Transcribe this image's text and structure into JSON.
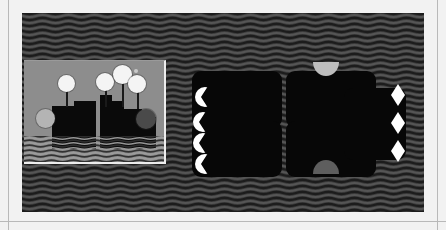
{
  "canvas": {
    "width": 446,
    "height": 230,
    "page_background": "#ffffff",
    "frame_color": "#b9b9b9"
  },
  "backdrop": {
    "name": "wavy-texture-backdrop",
    "base_color": "#3a3a3a",
    "wave_color": "#1c1c1c",
    "highlight_color": "#555555",
    "x": 22,
    "y": 13,
    "width": 402,
    "height": 199,
    "pattern": "horizontal-wavy-lines"
  },
  "inset_panel": {
    "name": "inset-panel",
    "background": "#8d8d8d",
    "border_color": "#ededed",
    "x": 24,
    "y": 60,
    "width": 140,
    "height": 101,
    "blocks": [
      {
        "name": "skyline-block-1",
        "x": 28,
        "y": 58,
        "w": 22,
        "h": 30,
        "color": "#0a0a0a"
      },
      {
        "name": "skyline-block-2",
        "x": 28,
        "y": 45,
        "w": 44,
        "h": 43,
        "color": "#0a0a0a"
      },
      {
        "name": "skyline-block-3",
        "x": 50,
        "y": 40,
        "w": 22,
        "h": 48,
        "color": "#0a0a0a"
      },
      {
        "name": "skyline-block-4",
        "x": 76,
        "y": 40,
        "w": 24,
        "h": 48,
        "color": "#0a0a0a"
      },
      {
        "name": "skyline-block-5",
        "x": 76,
        "y": 34,
        "w": 12,
        "h": 54,
        "color": "#0a0a0a"
      },
      {
        "name": "skyline-block-6",
        "x": 100,
        "y": 48,
        "w": 18,
        "h": 40,
        "color": "#0a0a0a"
      },
      {
        "name": "skyline-block-7",
        "x": 100,
        "y": 56,
        "w": 32,
        "h": 32,
        "color": "#0a0a0a"
      }
    ],
    "stems": [
      {
        "name": "stem-left",
        "x": 42,
        "y": 22,
        "h": 24
      },
      {
        "name": "stem-center",
        "x": 81,
        "y": 20,
        "h": 26
      },
      {
        "name": "stem-top",
        "x": 98,
        "y": 12,
        "h": 34
      },
      {
        "name": "stem-right",
        "x": 113,
        "y": 22,
        "h": 26
      }
    ],
    "circles": [
      {
        "name": "white-circle-left",
        "x": 34,
        "y": 14,
        "d": 17,
        "color": "#f4f4f4",
        "tone": ""
      },
      {
        "name": "white-circle-center",
        "x": 72,
        "y": 12,
        "d": 18,
        "color": "#f4f4f4",
        "tone": ""
      },
      {
        "name": "white-circle-top",
        "x": 89,
        "y": 4,
        "d": 19,
        "color": "#f4f4f4",
        "tone": ""
      },
      {
        "name": "white-circle-right",
        "x": 104,
        "y": 14,
        "d": 18,
        "color": "#f4f4f4",
        "tone": ""
      },
      {
        "name": "gray-circle",
        "x": 12,
        "y": 48,
        "d": 19,
        "color": "#b4b4b4",
        "tone": "gray"
      },
      {
        "name": "dark-circle",
        "x": 112,
        "y": 48,
        "d": 20,
        "color": "#4a4a4a",
        "tone": "dark"
      },
      {
        "name": "tiny-dot",
        "x": 110,
        "y": 8,
        "d": 4,
        "color": "#c9c9c9",
        "tone": "tiny"
      }
    ]
  },
  "cards": [
    {
      "name": "card-top-left",
      "x": 192,
      "y": 71,
      "w": 90,
      "h": 57,
      "color": "#070707"
    },
    {
      "name": "card-top-right",
      "x": 286,
      "y": 71,
      "w": 90,
      "h": 57,
      "color": "#070707"
    },
    {
      "name": "card-bottom-left",
      "x": 192,
      "y": 121,
      "w": 90,
      "h": 56,
      "color": "#070707"
    },
    {
      "name": "card-bottom-right",
      "x": 286,
      "y": 121,
      "w": 90,
      "h": 56,
      "color": "#070707"
    },
    {
      "name": "card-right",
      "x": 344,
      "y": 88,
      "w": 62,
      "h": 72,
      "color": "#070707"
    }
  ],
  "crescents": [
    {
      "name": "crescent-1",
      "x": 195,
      "y": 87,
      "d": 20
    },
    {
      "name": "crescent-2",
      "x": 193,
      "y": 112,
      "d": 20
    },
    {
      "name": "crescent-3",
      "x": 193,
      "y": 133,
      "d": 20
    },
    {
      "name": "crescent-4",
      "x": 195,
      "y": 154,
      "d": 20
    }
  ],
  "lenses": [
    {
      "name": "lens-1",
      "x": 391,
      "y": 84,
      "w": 14,
      "h": 22
    },
    {
      "name": "lens-2",
      "x": 391,
      "y": 112,
      "w": 14,
      "h": 22
    },
    {
      "name": "lens-3",
      "x": 391,
      "y": 140,
      "w": 14,
      "h": 22
    }
  ],
  "semicircles": [
    {
      "name": "semicircle-top",
      "x": 313,
      "y": 62,
      "w": 26,
      "h": 14,
      "color": "#bdbdbd",
      "tone": ""
    },
    {
      "name": "semicircle-bottom",
      "x": 313,
      "y": 160,
      "w": 26,
      "h": 14,
      "color": "#5e5e5e",
      "tone": "dim"
    }
  ]
}
